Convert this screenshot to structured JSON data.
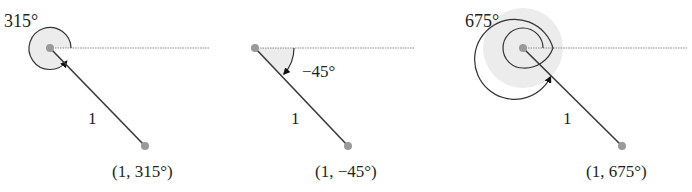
{
  "figure": {
    "panels": [
      {
        "angle_label": "315°",
        "radius_label": "1",
        "point_label": "(1, 315°)",
        "angle_deg": 315,
        "radius": 1
      },
      {
        "angle_label": "−45°",
        "radius_label": "1",
        "point_label": "(1, −45°)",
        "angle_deg": -45,
        "radius": 1
      },
      {
        "angle_label": "675°",
        "radius_label": "1",
        "point_label": "(1, 675°)",
        "angle_deg": 675,
        "radius": 1
      }
    ],
    "colors": {
      "line": "#3a3a3a",
      "point": "#9a9a9a",
      "shade": "#ececec",
      "dotted_axis": "#8a8a8a",
      "text": "#231f20"
    }
  }
}
